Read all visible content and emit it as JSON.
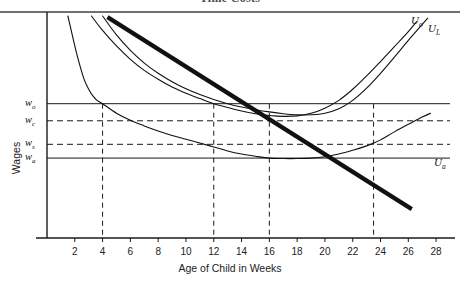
{
  "header": {
    "title": "Time Costs",
    "rule_color": "#6f6f6f"
  },
  "chart_data": {
    "type": "line",
    "title": "",
    "xlabel": "Age of Child in Weeks",
    "ylabel": "Wages",
    "xlim": [
      0,
      29
    ],
    "ylim": [
      0,
      10
    ],
    "grid": false,
    "legend": "none (curves labelled in-place at right)",
    "x_ticks": [
      2,
      4,
      6,
      8,
      10,
      12,
      14,
      16,
      18,
      20,
      22,
      24,
      26,
      28
    ],
    "y_ticks": [],
    "y_value_labels": [
      {
        "name": "w_o",
        "display": "w",
        "sub": "o",
        "value": 6.05,
        "line_style": "solid"
      },
      {
        "name": "w_c",
        "display": "w",
        "sub": "c",
        "value": 5.28,
        "line_style": "dashed"
      },
      {
        "name": "w_s",
        "display": "w",
        "sub": "s",
        "value": 4.22,
        "line_style": "dashed"
      },
      {
        "name": "w_a",
        "display": "w",
        "sub": "a",
        "value": 3.6,
        "line_style": "solid"
      }
    ],
    "vertical_reference_lines": [
      {
        "x": 4.0,
        "style": "dashed",
        "note": "U_a crosses w_o"
      },
      {
        "x": 12.0,
        "style": "dashed",
        "note": "U_o crosses w_o"
      },
      {
        "x": 16.0,
        "style": "dashed",
        "note": "U_a minimum / budget crosses w_c"
      },
      {
        "x": 23.5,
        "style": "dashed",
        "note": "budget line crosses w_a and U_a"
      }
    ],
    "series": [
      {
        "name": "U_o",
        "label": "U",
        "label_sub": "o",
        "style": "thin-solid",
        "shape": "convex U-shaped indifference curve",
        "points": [
          [
            3.2,
            10.0
          ],
          [
            4.0,
            9.35
          ],
          [
            5.0,
            8.65
          ],
          [
            6.0,
            8.05
          ],
          [
            7.0,
            7.55
          ],
          [
            8.0,
            7.15
          ],
          [
            9.0,
            6.8
          ],
          [
            10.0,
            6.52
          ],
          [
            11.0,
            6.28
          ],
          [
            12.0,
            6.05
          ],
          [
            13.0,
            5.88
          ],
          [
            14.0,
            5.72
          ],
          [
            15.0,
            5.6
          ],
          [
            16.0,
            5.52
          ],
          [
            17.0,
            5.48
          ],
          [
            18.0,
            5.5
          ],
          [
            19.0,
            5.62
          ],
          [
            20.0,
            5.85
          ],
          [
            21.0,
            6.2
          ],
          [
            22.0,
            6.7
          ],
          [
            23.0,
            7.3
          ],
          [
            24.0,
            7.95
          ],
          [
            25.0,
            8.62
          ],
          [
            26.0,
            9.3
          ],
          [
            26.6,
            9.75
          ]
        ]
      },
      {
        "name": "U_L",
        "label": "U",
        "label_sub": "L",
        "style": "thin-solid",
        "shape": "convex U-shaped indifference curve, right of U_o",
        "points": [
          [
            4.0,
            10.0
          ],
          [
            5.0,
            9.15
          ],
          [
            6.0,
            8.45
          ],
          [
            7.0,
            7.88
          ],
          [
            8.0,
            7.42
          ],
          [
            9.0,
            7.04
          ],
          [
            10.0,
            6.72
          ],
          [
            11.0,
            6.46
          ],
          [
            12.0,
            6.24
          ],
          [
            13.0,
            6.05
          ],
          [
            14.0,
            5.9
          ],
          [
            15.0,
            5.78
          ],
          [
            16.0,
            5.68
          ],
          [
            17.0,
            5.6
          ],
          [
            18.0,
            5.55
          ],
          [
            19.0,
            5.55
          ],
          [
            20.0,
            5.62
          ],
          [
            21.0,
            5.82
          ],
          [
            22.0,
            6.2
          ],
          [
            23.0,
            6.75
          ],
          [
            24.0,
            7.42
          ],
          [
            25.0,
            8.15
          ],
          [
            26.0,
            8.9
          ],
          [
            27.0,
            9.62
          ],
          [
            27.4,
            9.9
          ]
        ]
      },
      {
        "name": "U_a",
        "label": "U",
        "label_sub": "a",
        "style": "thin-solid",
        "shape": "steeply falling then flat-bottom U, lowest curve",
        "points": [
          [
            1.5,
            10.0
          ],
          [
            1.8,
            9.2
          ],
          [
            2.1,
            8.4
          ],
          [
            2.4,
            7.7
          ],
          [
            2.7,
            7.1
          ],
          [
            3.0,
            6.7
          ],
          [
            3.3,
            6.4
          ],
          [
            3.6,
            6.2
          ],
          [
            4.0,
            6.05
          ],
          [
            5.0,
            5.62
          ],
          [
            6.0,
            5.3
          ],
          [
            7.0,
            5.05
          ],
          [
            8.0,
            4.82
          ],
          [
            9.0,
            4.62
          ],
          [
            10.0,
            4.45
          ],
          [
            11.0,
            4.28
          ],
          [
            12.0,
            4.1
          ],
          [
            13.0,
            3.92
          ],
          [
            14.0,
            3.78
          ],
          [
            15.0,
            3.68
          ],
          [
            16.0,
            3.6
          ],
          [
            17.0,
            3.58
          ],
          [
            18.0,
            3.58
          ],
          [
            19.0,
            3.6
          ],
          [
            20.0,
            3.66
          ],
          [
            21.0,
            3.78
          ],
          [
            22.0,
            3.95
          ],
          [
            23.0,
            4.15
          ],
          [
            23.5,
            4.28
          ],
          [
            24.0,
            4.42
          ],
          [
            25.0,
            4.78
          ],
          [
            26.0,
            5.12
          ],
          [
            27.0,
            5.45
          ],
          [
            27.6,
            5.62
          ]
        ]
      },
      {
        "name": "budget-line",
        "label": "",
        "label_sub": "",
        "style": "thick-solid",
        "shape": "straight downward-sloping budget constraint",
        "points": [
          [
            4.35,
            9.95
          ],
          [
            26.25,
            1.3
          ]
        ]
      }
    ]
  }
}
